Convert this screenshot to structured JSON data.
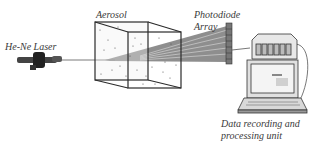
{
  "diagram": {
    "labels": {
      "laser": "He-Ne Laser",
      "aerosol": "Aerosol",
      "photodiode_line1": "Photodiode",
      "photodiode_line2": "Array",
      "unit_line1": "Data recording and",
      "unit_line2": "processing unit"
    },
    "components": [
      "He-Ne Laser",
      "Aerosol",
      "Photodiode Array",
      "Data recording and processing unit"
    ],
    "colors": {
      "line": "#2b2b2b",
      "beam": "#6e6e6e",
      "text": "#3a3a3a"
    }
  }
}
